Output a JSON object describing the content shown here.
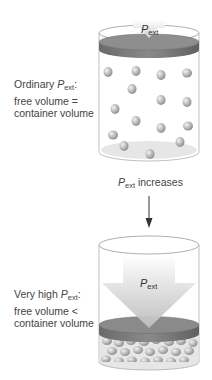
{
  "top_state": {
    "label_line1_prefix": "Ordinary ",
    "label_P": "P",
    "label_sub": "ext",
    "label_line1_suffix": ":",
    "label_line2": "free volume =",
    "label_line3": "container volume",
    "piston_label_P": "P",
    "piston_label_sub": "ext"
  },
  "transition": {
    "P": "P",
    "sub": "ext",
    "text": " increases"
  },
  "bottom_state": {
    "label_line1_prefix": "Very high ",
    "label_P": "P",
    "label_sub": "ext",
    "label_line1_suffix": ":",
    "label_line2": "free volume <",
    "label_line3": "container volume",
    "arrow_label_P": "P",
    "arrow_label_sub": "ext"
  },
  "colors": {
    "piston": "#7a7a7a",
    "piston_top": "#8c8c8c",
    "particle": "#b8b8b8",
    "arrow": "#d0d0d0"
  }
}
